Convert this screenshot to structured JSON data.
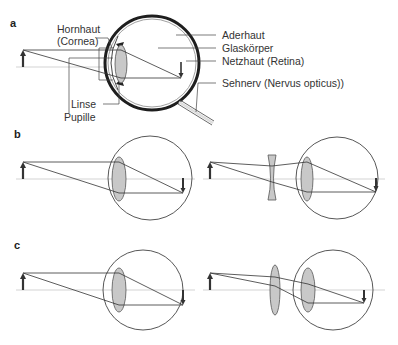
{
  "figure": {
    "panels": [
      {
        "id": "a",
        "label": "a",
        "description": "Anatomy of the eye with image formation",
        "annotations": {
          "hornhaut_line1": "Hornhaut",
          "hornhaut_line2": "(Cornea)",
          "linse": "Linse",
          "pupille": "Pupille",
          "aderhaut": "Aderhaut",
          "glaskoerper": "Glaskörper",
          "netzhaut": "Netzhaut (Retina)",
          "sehnerv": "Sehnerv (Nervus opticus))"
        }
      },
      {
        "id": "b",
        "label": "b",
        "description": "Myopia (image in front of retina) and correction with concave lens"
      },
      {
        "id": "c",
        "label": "c",
        "description": "Hyperopia (image behind retina) and correction with convex lens"
      }
    ],
    "colors": {
      "line": "#333333",
      "lens_fill": "#c8c8c8",
      "axis": "#bdbdbd",
      "eye_outline": "#222222"
    }
  }
}
